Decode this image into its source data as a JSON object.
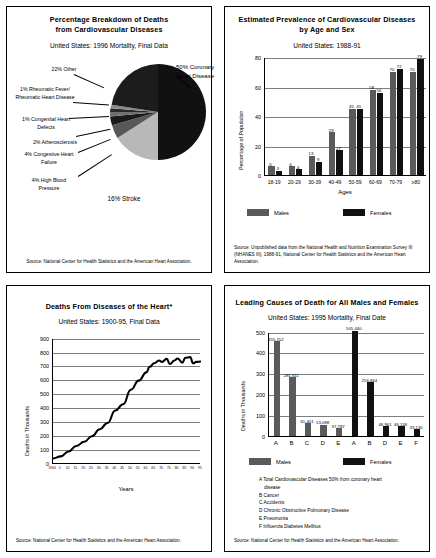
{
  "panels": {
    "pie": {
      "title_line1": "Percentage Breakdown of Deaths",
      "title_line2": "from Cardiovascular Diseases",
      "subtitle": "United States: 1996 Mortality, Final Data",
      "source": "Source: National Center for Health Statistics and the American Heart Association.",
      "labels": {
        "other": "22% Other",
        "rheumatic": "1% Rheumatic Fever/ Rheumatic Heart Disease",
        "congenital": "1% Congenital Heart Defects",
        "athero": "2% Atherosclerosis",
        "chf": "4% Congestive Heart Failure",
        "hbp": "4% High Blood Pressure",
        "stroke": "16% Stroke",
        "coronary": "50% Coronary Heart Disease"
      }
    },
    "prevalence": {
      "title_line1": "Estimated Prevalence of Cardiovascular Diseases",
      "title_line2": "by Age and Sex",
      "subtitle": "United States: 1988-91",
      "source": "Source: Unpublished data from the National Health and Nutrition Examination Survey III (NHANES III), 1988-91, National Center for Health Statistics and the American Heart Association.",
      "legend_males": "Males",
      "legend_females": "Females"
    },
    "heart_deaths": {
      "title": "Deaths From Diseases of the Heart*",
      "subtitle": "United States: 1900-95, Final Data",
      "source": "Source: National Center for Health Statistics and the American Heart Association."
    },
    "leading_causes": {
      "title": "Leading Causes of Death for All Males and Females",
      "subtitle": "United States: 1995 Mortality, Final Date",
      "source": "Source: National Center for Health Statistics and the American Heart Association.",
      "legend_males": "Males",
      "legend_females": "Females",
      "key": [
        "A Total Cardiovascular Diseases 50% from coronary heart",
        "disease",
        "B Cancer",
        "C Accidents",
        "D Chronic Obstructive Pulmonary Disease",
        "E Pneumonia",
        "F Influenza Diabetes Mellitus"
      ]
    }
  },
  "chart_data": [
    {
      "id": "pie",
      "type": "pie",
      "title": "Percentage Breakdown of Deaths from Cardiovascular Diseases",
      "subtitle": "United States: 1996 Mortality, Final Data",
      "slices": [
        {
          "label": "Coronary Heart Disease",
          "value": 50,
          "color": "#111111"
        },
        {
          "label": "Stroke",
          "value": 16,
          "color": "#b8b8b8"
        },
        {
          "label": "High Blood Pressure",
          "value": 4,
          "color": "#585858"
        },
        {
          "label": "Congestive Heart Failure",
          "value": 4,
          "color": "#1a1a1a"
        },
        {
          "label": "Atherosclerosis",
          "value": 2,
          "color": "#707070"
        },
        {
          "label": "Congenital Heart Defects",
          "value": 1,
          "color": "#2a2a2a"
        },
        {
          "label": "Rheumatic Fever/ Rheumatic Heart Disease",
          "value": 1,
          "color": "#8a8a8a"
        },
        {
          "label": "Other",
          "value": 22,
          "color": "#1c1c1c"
        }
      ]
    },
    {
      "id": "prevalence",
      "type": "bar",
      "title": "Estimated Prevalence of Cardiovascular Diseases by Age and Sex",
      "subtitle": "United States: 1988-91",
      "xlabel": "Ages",
      "ylabel": "Percentage of Population",
      "ylim": [
        0,
        80
      ],
      "yticks": [
        0,
        20,
        40,
        60,
        80
      ],
      "grid": true,
      "legend_position": "bottom",
      "categories": [
        "18-19",
        "20-29",
        "30-39",
        "40-49",
        "50-59",
        "60-69",
        "70-79",
        "≥80"
      ],
      "series": [
        {
          "name": "Males",
          "values": [
            6,
            6,
            13,
            29,
            45,
            58,
            70,
            70
          ]
        },
        {
          "name": "Females",
          "values": [
            3,
            4,
            9,
            17,
            45,
            56,
            72,
            79
          ]
        }
      ]
    },
    {
      "id": "heart_deaths",
      "type": "line",
      "title": "Deaths From Diseases of the Heart*",
      "subtitle": "United States: 1900-95, Final Data",
      "xlabel": "Years",
      "ylabel": "Deaths in Thousands",
      "ylim": [
        0,
        900
      ],
      "yticks": [
        0,
        100,
        200,
        300,
        400,
        500,
        600,
        700,
        800,
        900
      ],
      "grid": true,
      "xticks": [
        "1900",
        "5",
        "10",
        "15",
        "20",
        "25",
        "30",
        "35",
        "40",
        "45",
        "50",
        "55",
        "60",
        "65",
        "70",
        "75",
        "80",
        "85",
        "90",
        "95"
      ],
      "x": [
        1900,
        1905,
        1910,
        1915,
        1920,
        1925,
        1930,
        1935,
        1940,
        1945,
        1950,
        1955,
        1960,
        1962,
        1965,
        1968,
        1970,
        1973,
        1975,
        1978,
        1980,
        1983,
        1985,
        1988,
        1990,
        1992,
        1995
      ],
      "values": [
        40,
        55,
        90,
        130,
        160,
        200,
        250,
        295,
        385,
        430,
        535,
        600,
        660,
        700,
        725,
        745,
        735,
        757,
        720,
        745,
        760,
        730,
        765,
        770,
        725,
        735,
        738
      ]
    },
    {
      "id": "leading_causes",
      "type": "bar",
      "title": "Leading Causes of Death for All Males and Females",
      "subtitle": "United States: 1995 Mortality, Final Date",
      "ylabel": "Deaths in Thousands",
      "ylim": [
        0,
        500
      ],
      "yticks": [
        0,
        100,
        200,
        300,
        400,
        500
      ],
      "grid": true,
      "legend_position": "bottom",
      "groups": [
        {
          "sex": "Males",
          "code": "A",
          "value": 455152,
          "label": "455,152"
        },
        {
          "sex": "Males",
          "code": "B",
          "value": 281611,
          "label": "281,611"
        },
        {
          "sex": "Males",
          "code": "C",
          "value": 61401,
          "label": "61,401"
        },
        {
          "sex": "Males",
          "code": "D",
          "value": 53098,
          "label": "53,098"
        },
        {
          "sex": "Males",
          "code": "E",
          "value": 37787,
          "label": "37,787"
        },
        {
          "sex": "Females",
          "code": "A",
          "value": 505440,
          "label": "505,440"
        },
        {
          "sex": "Females",
          "code": "B",
          "value": 256844,
          "label": "256,844"
        },
        {
          "sex": "Females",
          "code": "D",
          "value": 46961,
          "label": "46,961"
        },
        {
          "sex": "Females",
          "code": "E",
          "value": 46136,
          "label": "46,136"
        },
        {
          "sex": "Females",
          "code": "F",
          "value": 33130,
          "label": "33,130"
        }
      ]
    }
  ]
}
